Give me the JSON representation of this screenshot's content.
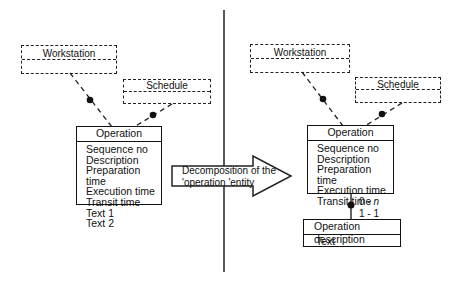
{
  "diagram": {
    "type": "entity-relationship decomposition",
    "divider": "vertical line separating before/after",
    "left": {
      "related_entities": [
        {
          "name": "Workstation",
          "style": "dashed"
        },
        {
          "name": "Schedule",
          "style": "dashed"
        }
      ],
      "entity": {
        "name": "Operation",
        "attributes": [
          "Sequence no",
          "Description",
          "Preparation time",
          "Execution time",
          "Transit time",
          "Text 1",
          "Text 2"
        ]
      }
    },
    "arrow": {
      "line1": "Decomposition of the",
      "line2": "'operation 'entity"
    },
    "right": {
      "related_entities": [
        {
          "name": "Workstation",
          "style": "dashed"
        },
        {
          "name": "Schedule",
          "style": "dashed"
        }
      ],
      "entity": {
        "name": "Operation",
        "attributes": [
          "Sequence no",
          "Description",
          "Preparation time",
          "Execution time",
          "Transit time"
        ]
      },
      "relationship": {
        "cardinality_top": "0 - n",
        "cardinality_top_num": "0 - ",
        "cardinality_top_var": "n",
        "cardinality_bottom": "1 - 1"
      },
      "child_entity": {
        "name": "Operation description",
        "attributes": [
          "Text"
        ]
      }
    }
  }
}
